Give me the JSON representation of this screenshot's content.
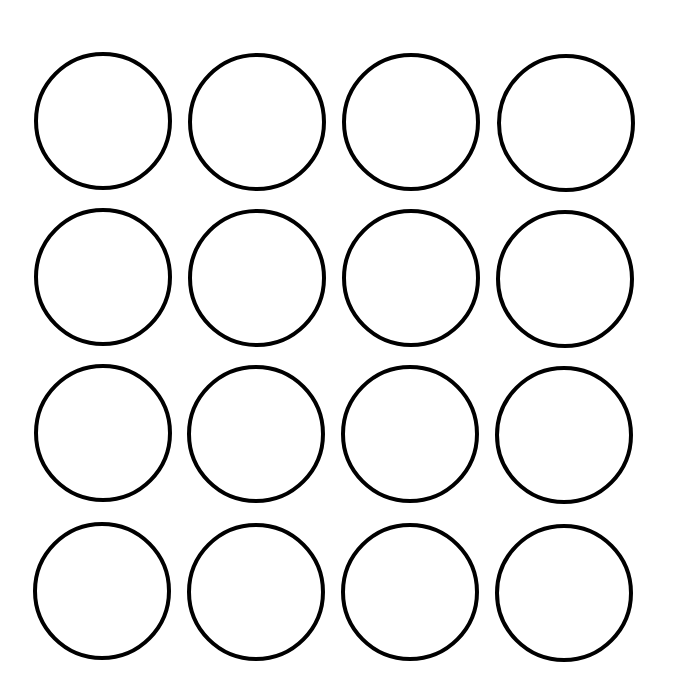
{
  "diagram": {
    "title": "",
    "background": "#ffffff",
    "stroke_color": "#000000",
    "stroke_width": 4,
    "rows": 4,
    "columns": 4,
    "circles": [
      {
        "row": 1,
        "col": 1,
        "cx": 103,
        "cy": 121,
        "r": 67
      },
      {
        "row": 1,
        "col": 2,
        "cx": 257,
        "cy": 122,
        "r": 67
      },
      {
        "row": 1,
        "col": 3,
        "cx": 411,
        "cy": 122,
        "r": 67
      },
      {
        "row": 1,
        "col": 4,
        "cx": 566,
        "cy": 123,
        "r": 67
      },
      {
        "row": 2,
        "col": 1,
        "cx": 103,
        "cy": 277,
        "r": 67
      },
      {
        "row": 2,
        "col": 2,
        "cx": 257,
        "cy": 278,
        "r": 67
      },
      {
        "row": 2,
        "col": 3,
        "cx": 411,
        "cy": 278,
        "r": 67
      },
      {
        "row": 2,
        "col": 4,
        "cx": 565,
        "cy": 279,
        "r": 67
      },
      {
        "row": 3,
        "col": 1,
        "cx": 103,
        "cy": 433,
        "r": 67
      },
      {
        "row": 3,
        "col": 2,
        "cx": 256,
        "cy": 434,
        "r": 67
      },
      {
        "row": 3,
        "col": 3,
        "cx": 410,
        "cy": 434,
        "r": 67
      },
      {
        "row": 3,
        "col": 4,
        "cx": 564,
        "cy": 435,
        "r": 67
      },
      {
        "row": 4,
        "col": 1,
        "cx": 102,
        "cy": 591,
        "r": 67
      },
      {
        "row": 4,
        "col": 2,
        "cx": 256,
        "cy": 592,
        "r": 67
      },
      {
        "row": 4,
        "col": 3,
        "cx": 410,
        "cy": 592,
        "r": 67
      },
      {
        "row": 4,
        "col": 4,
        "cx": 564,
        "cy": 593,
        "r": 67
      }
    ]
  }
}
